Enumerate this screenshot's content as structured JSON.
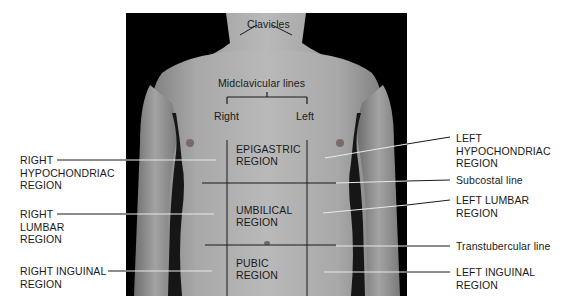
{
  "figure": {
    "top_labels": {
      "clavicles": "Clavicles",
      "midclavicular_lines": "Midclavicular lines",
      "right": "Right",
      "left": "Left"
    },
    "regions_center": {
      "epigastric": [
        "EPIGASTRIC",
        "REGION"
      ],
      "umbilical": [
        "UMBILICAL",
        "REGION"
      ],
      "pubic": [
        "PUBIC",
        "REGION"
      ]
    },
    "left_side_labels": [
      {
        "lines": [
          "RIGHT",
          "HYPOCHONDRIAC",
          "REGION"
        ]
      },
      {
        "lines": [
          "RIGHT",
          "LUMBAR",
          "REGION"
        ]
      },
      {
        "lines": [
          "RIGHT INGUINAL",
          "REGION"
        ]
      }
    ],
    "right_side_labels": [
      {
        "lines": [
          "LEFT",
          "HYPOCHONDRIAC",
          "REGION"
        ]
      },
      {
        "lines": [
          "Subcostal line"
        ]
      },
      {
        "lines": [
          "LEFT LUMBAR",
          "REGION"
        ]
      },
      {
        "lines": [
          "Transtubercular line"
        ]
      },
      {
        "lines": [
          "LEFT INGUINAL",
          "REGION"
        ]
      }
    ],
    "colors": {
      "background": "#ffffff",
      "photo_bg": "#000000",
      "skin_light": "#b8b8b8",
      "skin_mid": "#9a9a9a",
      "text": "#1a1a1a",
      "leader_line": "#ffffff",
      "grid_line": "#1a1a1a"
    }
  }
}
